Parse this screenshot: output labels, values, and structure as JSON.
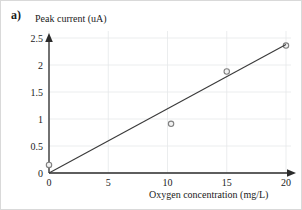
{
  "figure": {
    "panel_label": "a)",
    "background_color": "#ffffff",
    "border_color": "#d9d9d9"
  },
  "chart_data": {
    "type": "scatter",
    "title": "",
    "xlabel": "Oxygen concentration (mg/L)",
    "ylabel": "Peak current (uA)",
    "xlim": [
      0,
      20
    ],
    "ylim": [
      0,
      2.5
    ],
    "xticks": [
      0,
      5,
      10,
      15,
      20
    ],
    "xtick_labels": [
      "0",
      "5",
      "10",
      "15",
      "20"
    ],
    "yticks": [
      0,
      0.5,
      1,
      1.5,
      2,
      2.5
    ],
    "ytick_labels": [
      "0",
      "0.5",
      "1",
      "1.5",
      "2",
      "2.5"
    ],
    "grid": true,
    "legend": null,
    "series": [
      {
        "name": "Measured peak current",
        "marker": "open-circle",
        "marker_color": "#808080",
        "x": [
          0,
          10.3,
          15,
          20
        ],
        "y": [
          0.15,
          0.91,
          1.88,
          2.36
        ]
      },
      {
        "name": "Linear fit",
        "type": "line",
        "line_color": "#3a3a3a",
        "x": [
          0,
          20
        ],
        "y": [
          0.0,
          2.38
        ]
      }
    ]
  }
}
